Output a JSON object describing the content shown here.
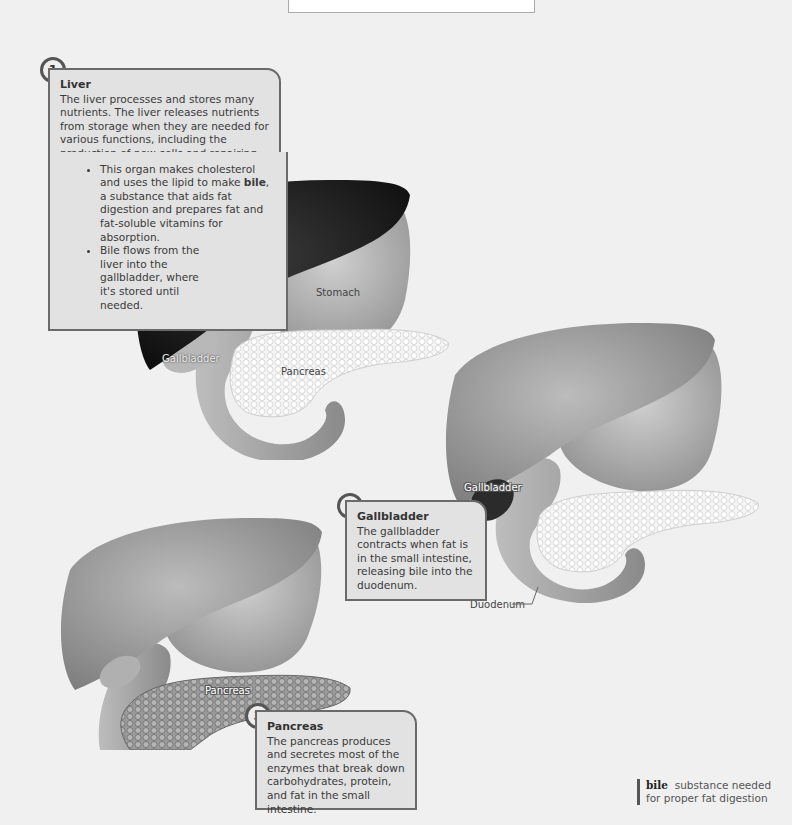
{
  "title": {
    "text": "and Pancreas"
  },
  "callouts": [
    {
      "number": "1",
      "heading": "Liver",
      "intro": "The liver processes and stores many nutrients. The liver releases nutrients from storage when they are needed for various functions, including the production of new cells and repairing damaged cells.",
      "bullets": [
        {
          "before": "This organ makes cholesterol and uses the lipid to make ",
          "bold": "bile",
          "after": ", a substance that aids fat digestion and prepares fat and fat-soluble vitamins for absorption."
        },
        {
          "before": "Bile flows from the liver into the gallbladder, where it's stored until needed.",
          "bold": "",
          "after": ""
        }
      ]
    },
    {
      "number": "2",
      "heading": "Gallbladder",
      "intro": "The gallbladder contracts when fat is in the small intestine, releasing bile into the duodenum."
    },
    {
      "number": "3",
      "heading": "Pancreas",
      "intro": "The pancreas produces and secretes most of the enzymes that break down carbohydrates, protein, and fat in the small intestine."
    }
  ],
  "diagram_labels": {
    "d1": {
      "liver": "Liver",
      "stomach": "Stomach",
      "gallbladder": "Gallbladder",
      "pancreas": "Pancreas"
    },
    "d2": {
      "gallbladder": "Gallbladder",
      "duodenum": "Duodenum"
    },
    "d3": {
      "pancreas": "Pancreas"
    }
  },
  "glossary": {
    "term": "bile",
    "definition_line1": "substance needed",
    "definition_line2": "for proper fat digestion"
  },
  "colors": {
    "background": "#f0f0f0",
    "callout_bg": "#e2e2e2",
    "callout_border": "#6a6a6a",
    "liver_highlight": "#1a1a1a",
    "organ_gray": "#a9a9a9"
  }
}
